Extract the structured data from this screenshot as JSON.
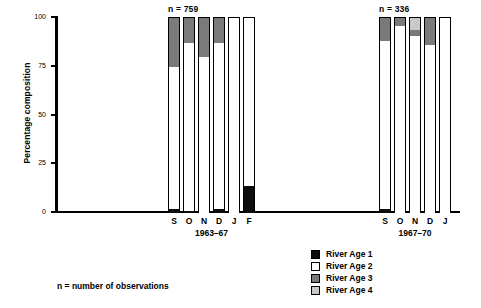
{
  "chart_data": {
    "type": "bar",
    "title": "",
    "xlabel": "",
    "ylabel": "Percentage composition",
    "ylim": [
      0,
      100
    ],
    "yticks": [
      0,
      25,
      50,
      75,
      100
    ],
    "ytick_labels": [
      "0",
      "25",
      "50",
      "75",
      "100"
    ],
    "grid": false,
    "stacked": true,
    "legend_position": "bottom-center",
    "series": [
      {
        "name": "River Age 1",
        "color": "#0d0d0d"
      },
      {
        "name": "River Age 2",
        "color": "#ffffff"
      },
      {
        "name": "River Age 3",
        "color": "#7a7a7a"
      },
      {
        "name": "River Age 4",
        "color": "#c9c9c9"
      }
    ],
    "groups": [
      {
        "period": "1963–67",
        "n_label": "n = 759",
        "n": 759,
        "categories": [
          "S",
          "O",
          "N",
          "D",
          "J",
          "F"
        ],
        "bars": [
          {
            "category": "S",
            "age1": 2,
            "age2": 73,
            "age3": 25,
            "age4": 0
          },
          {
            "category": "O",
            "age1": 1,
            "age2": 86,
            "age3": 13,
            "age4": 0
          },
          {
            "category": "N",
            "age1": 0,
            "age2": 80,
            "age3": 20,
            "age4": 0
          },
          {
            "category": "D",
            "age1": 2,
            "age2": 85,
            "age3": 13,
            "age4": 0
          },
          {
            "category": "J",
            "age1": 0,
            "age2": 100,
            "age3": 0,
            "age4": 0
          },
          {
            "category": "F",
            "age1": 14,
            "age2": 86,
            "age3": 0,
            "age4": 0
          }
        ]
      },
      {
        "period": "1967–70",
        "n_label": "n = 336",
        "n": 336,
        "categories": [
          "S",
          "O",
          "N",
          "D",
          "J"
        ],
        "bars": [
          {
            "category": "S",
            "age1": 2,
            "age2": 86,
            "age3": 12,
            "age4": 0
          },
          {
            "category": "O",
            "age1": 0,
            "age2": 96,
            "age3": 4,
            "age4": 0
          },
          {
            "category": "N",
            "age1": 0,
            "age2": 91,
            "age3": 3,
            "age4": 6
          },
          {
            "category": "D",
            "age1": 0,
            "age2": 86,
            "age3": 14,
            "age4": 0
          },
          {
            "category": "J",
            "age1": 0,
            "age2": 100,
            "age3": 0,
            "age4": 0
          }
        ]
      }
    ]
  },
  "footnote": "n = number of observations",
  "legend": {
    "items": [
      {
        "label": "River Age 1",
        "key": "age1"
      },
      {
        "label": "River Age 2",
        "key": "age2"
      },
      {
        "label": "River Age 3",
        "key": "age3"
      },
      {
        "label": "River Age 4",
        "key": "age4"
      }
    ]
  }
}
